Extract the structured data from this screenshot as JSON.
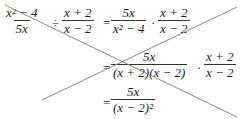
{
  "equation": {
    "line1": {
      "frac1": {
        "num": "x² − 4",
        "den": "5x"
      },
      "op1": "÷",
      "frac2": {
        "num": "x + 2",
        "den": "x − 2"
      },
      "eq": "=",
      "frac3": {
        "num": "5x",
        "den": "x² − 4"
      },
      "op2": "·",
      "frac4": {
        "num": "x + 2",
        "den": "x − 2"
      }
    },
    "line2": {
      "eq": "=",
      "frac1": {
        "num": "5x",
        "den": "(x + 2)(x − 2)"
      },
      "op": "·",
      "frac2": {
        "num": "x + 2",
        "den": "x − 2"
      }
    },
    "line3": {
      "eq": "=",
      "frac1": {
        "num": "5x",
        "den": "(x − 2)²"
      }
    }
  },
  "strike_lines": {
    "color": "#8a8a8a",
    "line_a": {
      "x1": 5,
      "y1": 5,
      "x2": 237,
      "y2": 117
    },
    "line_b": {
      "x1": 237,
      "y1": 7,
      "x2": 42,
      "y2": 100
    }
  }
}
